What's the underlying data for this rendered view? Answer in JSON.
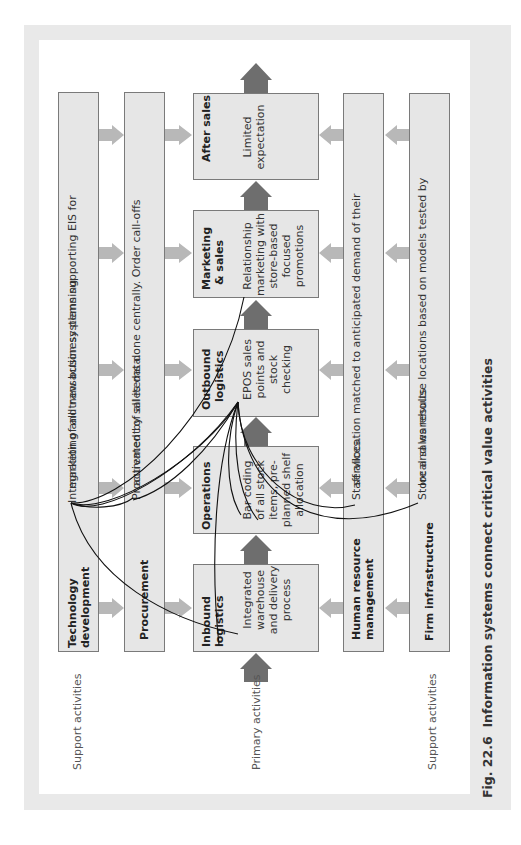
{
  "figure": {
    "caption_number": "Fig. 22.6",
    "caption_text": "Information systems connect critical value activities",
    "colors": {
      "frame": "#e9e9e9",
      "box_fill": "#e6e6e6",
      "box_border": "#7a7a7a",
      "support_arrow": "#b8b8b8",
      "primary_arrow": "#6e6e6e",
      "connector": "#111111"
    }
  },
  "side_labels": {
    "left_support": "Support activities",
    "primary": "Primary activities",
    "right_support": "Support activities"
  },
  "support_left": [
    {
      "title_line1": "Technology",
      "title_line2": "development",
      "desc_line1": "Integration of all transaction systems supporting EIS for",
      "desc_line2": "marketing and new business planning"
    },
    {
      "title_line1": "Procurement",
      "desc_line1": "Procurement of all items done centrally. Order call-offs",
      "desc_line2": "activated by sales data."
    }
  ],
  "support_right": [
    {
      "title_line1": "Human resource",
      "title_line2": "management",
      "desc_line1": "Staff allocation matched to anticipated demand of their",
      "desc_line2": "services."
    },
    {
      "title_line1": "Firm infrastructure",
      "desc_line1": "Store and warehouse locations based on models tested by",
      "desc_line2": "local sales results"
    }
  ],
  "primary": [
    {
      "title_line1": "Inbound",
      "title_line2": "logistics",
      "desc": [
        "Integrated",
        "warehouse",
        "and delivery",
        "process"
      ]
    },
    {
      "title_line1": "Operations",
      "title_line2": "",
      "desc": [
        "Bar coding",
        "of all stock",
        "items, pre-",
        "planned shelf",
        "allocation"
      ]
    },
    {
      "title_line1": "Outbound",
      "title_line2": "logistics",
      "desc": [
        "EPOS sales",
        "points and",
        "stock",
        "checking"
      ]
    },
    {
      "title_line1": "Marketing",
      "title_line2": "& sales",
      "desc": [
        "Relationship",
        "marketing with",
        "store-based",
        "focused",
        "promotions"
      ]
    },
    {
      "title_line1": "After sales",
      "title_line2": "",
      "desc": [
        "Limited",
        "expectation"
      ]
    }
  ]
}
